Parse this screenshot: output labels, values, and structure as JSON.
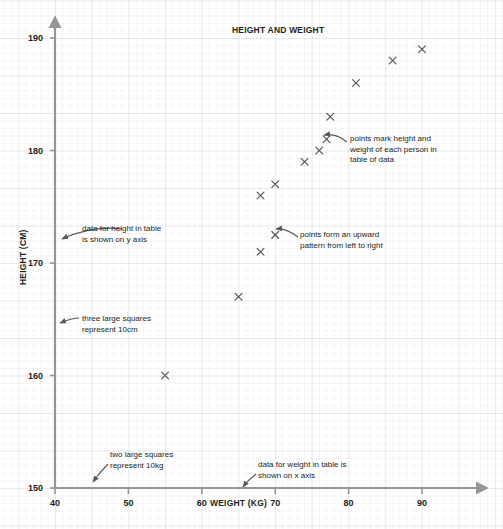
{
  "chart_data": {
    "type": "scatter",
    "title": "HEIGHT AND WEIGHT",
    "xlabel": "WEIGHT (KG)",
    "ylabel": "HEIGHT (CM)",
    "xlim": [
      40,
      93
    ],
    "ylim": [
      150,
      190
    ],
    "xticks": [
      40,
      50,
      60,
      70,
      80,
      90
    ],
    "yticks": [
      150,
      160,
      170,
      180,
      190
    ],
    "grid": true,
    "grid_note_x": "two large squares represent 10kg",
    "grid_note_y": "three large squares represent 10cm",
    "legend": null,
    "marker": "x",
    "marker_color": "#58595b",
    "series": [
      {
        "name": "people",
        "points": [
          {
            "weight": 55,
            "height": 160
          },
          {
            "weight": 65,
            "height": 167
          },
          {
            "weight": 68,
            "height": 171
          },
          {
            "weight": 70,
            "height": 172.5
          },
          {
            "weight": 68,
            "height": 176
          },
          {
            "weight": 70,
            "height": 177
          },
          {
            "weight": 74,
            "height": 179
          },
          {
            "weight": 76,
            "height": 180
          },
          {
            "weight": 77,
            "height": 181
          },
          {
            "weight": 77.5,
            "height": 183
          },
          {
            "weight": 81,
            "height": 186
          },
          {
            "weight": 86,
            "height": 188
          },
          {
            "weight": 90,
            "height": 189
          }
        ]
      }
    ],
    "annotations": [
      {
        "id": "height-axis-note",
        "text": "data for height in table\nis shown on y axis",
        "text_x": 82,
        "text_y": 224,
        "arrow": {
          "x1": 122,
          "y1": 229,
          "cx": 92,
          "cy": 225,
          "x2": 62,
          "y2": 239
        }
      },
      {
        "id": "height-grid-note",
        "text": "three large squares\nrepresent 10cm",
        "text_x": 82,
        "text_y": 314,
        "arrow": {
          "x1": 79,
          "y1": 318,
          "cx": 72,
          "cy": 318,
          "x2": 60,
          "y2": 323
        }
      },
      {
        "id": "weight-grid-note",
        "text": "two large squares\nrepresent 10kg",
        "text_x": 110,
        "text_y": 450,
        "arrow": {
          "x1": 108,
          "y1": 464,
          "cx": 100,
          "cy": 472,
          "x2": 93,
          "y2": 482
        }
      },
      {
        "id": "weight-axis-note",
        "text": "data for weight in table is\nshown on x axis",
        "text_x": 258,
        "text_y": 460,
        "arrow": {
          "x1": 256,
          "y1": 474,
          "cx": 248,
          "cy": 480,
          "x2": 243,
          "y2": 487
        }
      },
      {
        "id": "points-meaning-note",
        "text": "points mark height and\nweight of each person in\ntable of data",
        "text_x": 350,
        "text_y": 134,
        "arrow": {
          "x1": 347,
          "y1": 142,
          "cx": 336,
          "cy": 133,
          "x2": 324,
          "y2": 135
        }
      },
      {
        "id": "upward-pattern-note",
        "text": "points form an upward\npattern from left to right",
        "text_x": 300,
        "text_y": 230,
        "arrow": {
          "x1": 298,
          "y1": 237,
          "cx": 286,
          "cy": 228,
          "x2": 276,
          "y2": 229
        }
      }
    ]
  },
  "axes": {
    "x_tick_labels": [
      "40",
      "50",
      "60",
      "70",
      "80",
      "90"
    ],
    "y_tick_labels": [
      "190",
      "180",
      "170",
      "160",
      "150"
    ]
  },
  "colors": {
    "axis": "#939598",
    "text": "#231f20",
    "marker": "#58595b",
    "grid": "#e8e8e8",
    "background": "#ffffff"
  }
}
